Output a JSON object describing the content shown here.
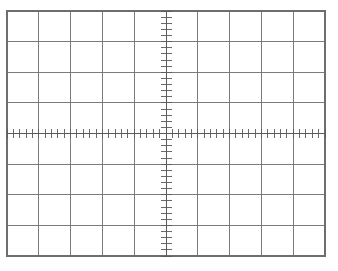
{
  "figure": {
    "name": "oscilloscope-graticule",
    "background_color": "#ffffff",
    "grid_color": "#6e6e6e",
    "axis_color": "#5a5a5a",
    "tick_color": "#5a5a5a"
  },
  "chart_data": {
    "type": "scatter",
    "title": "",
    "subtitle": "",
    "xlabel": "",
    "ylabel": "",
    "annotations": [],
    "legend": [],
    "grid": true,
    "legend_position": "none",
    "series": [],
    "x": [],
    "values": [],
    "categories": [],
    "xlim": [
      -5,
      5
    ],
    "ylim": [
      -4,
      4
    ],
    "x_major_divisions": 10,
    "y_major_divisions": 8,
    "x_minor_per_division": 5,
    "y_minor_per_division": 5,
    "x_tick_labels": [],
    "y_tick_labels": [],
    "center_x_division": 5,
    "center_y_division": 4,
    "plot_area_px": {
      "left": 7,
      "top": 11,
      "right": 325,
      "bottom": 256,
      "width": 318,
      "height": 245
    },
    "tick_marks": {
      "horizontal_axis_tick_length_px": 9,
      "vertical_axis_tick_length_px": 11,
      "horizontal_axis_tick_count": 51,
      "vertical_axis_tick_count": 41
    },
    "line_widths": {
      "border_px": 1.1,
      "gridline_px": 0.9,
      "axis_px": 1.0,
      "tick_px": 0.9
    }
  }
}
